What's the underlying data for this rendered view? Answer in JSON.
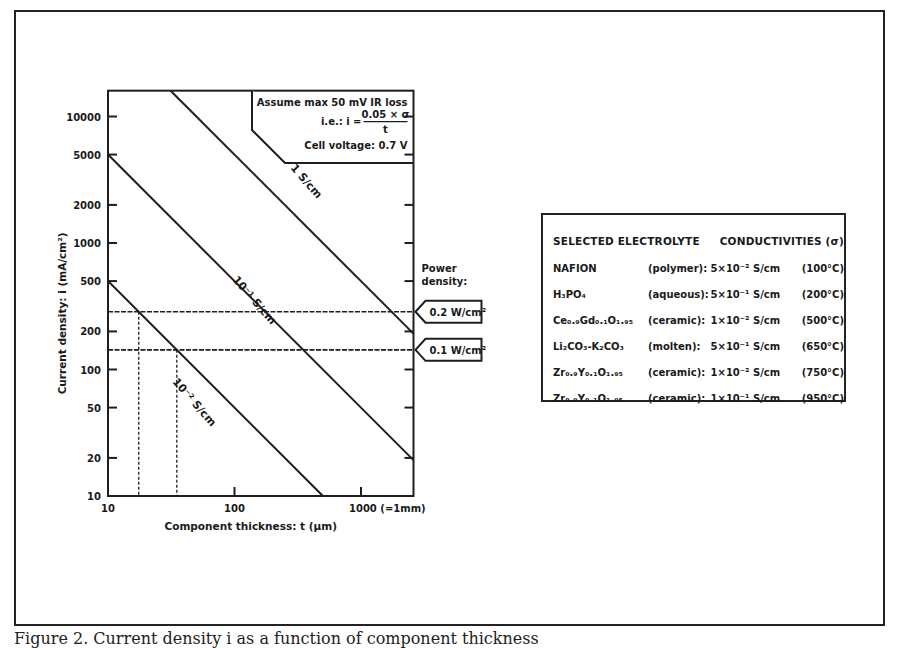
{
  "chart_data": {
    "type": "line",
    "xscale": "log",
    "yscale": "log",
    "xlabel": "Component thickness: t (µm)",
    "ylabel": "Current density: i (mA/cm²)",
    "xlim": [
      10,
      2600
    ],
    "ylim": [
      10,
      16000
    ],
    "xticks": [
      10,
      100,
      1000
    ],
    "xtick_labels": [
      "10",
      "100",
      "1000 (=1mm)"
    ],
    "yticks": [
      10,
      20,
      50,
      100,
      200,
      500,
      1000,
      2000,
      5000,
      10000
    ],
    "ytick_labels": [
      "10",
      "20",
      "50",
      "100",
      "200",
      "500",
      "1000",
      "2000",
      "5000",
      "10000"
    ],
    "formula": "i = 0.05 × σ / t",
    "series": [
      {
        "name": "1 S/cm",
        "sigma_S_per_cm": 1,
        "x": [
          31.25,
          2600
        ],
        "y": [
          16000,
          192
        ]
      },
      {
        "name": "10⁻¹ S/cm",
        "sigma_S_per_cm": 0.1,
        "x": [
          10,
          2600
        ],
        "y": [
          5000,
          19.2
        ]
      },
      {
        "name": "10⁻² S/cm",
        "sigma_S_per_cm": 0.01,
        "x": [
          10,
          500
        ],
        "y": [
          500,
          10
        ]
      }
    ],
    "reference_lines": [
      {
        "type": "horizontal",
        "y": 286,
        "label": "0.2 W/cm²",
        "style": "dashed"
      },
      {
        "type": "horizontal",
        "y": 143,
        "label": "0.1 W/cm²",
        "style": "dashed"
      },
      {
        "type": "vertical",
        "x": 17.5,
        "y_top": 286,
        "style": "dotted"
      },
      {
        "type": "vertical",
        "x": 35,
        "y_top": 143,
        "style": "dotted"
      }
    ],
    "annotations": {
      "box_line1": "Assume max 50 mV IR loss",
      "box_prefix": "i.e.:  i =",
      "box_numerator": "0.05 × σ",
      "box_denominator": "t",
      "box_line3": "Cell voltage: 0.7 V",
      "power_density_title_1": "Power",
      "power_density_title_2": "density:"
    },
    "line_labels": [
      "1 S/cm",
      "10⁻¹ S/cm",
      "10⁻² S/cm"
    ],
    "legend_position": "none",
    "grid": false
  },
  "table": {
    "header": [
      "SELECTED",
      "ELECTROLYTE",
      "CONDUCTIVITIES (σ)"
    ],
    "rows": [
      {
        "material": "NAFION",
        "type": "(polymer):",
        "value": "5×10⁻² S/cm",
        "temp": "(100°C)"
      },
      {
        "material": "H₃PO₄",
        "type": "(aqueous):",
        "value": "5×10⁻¹ S/cm",
        "temp": "(200°C)"
      },
      {
        "material": "Ce₀.₉Gd₀.₁O₁.₉₅",
        "type": "(ceramic):",
        "value": "1×10⁻² S/cm",
        "temp": "(500°C)"
      },
      {
        "material": "Li₂CO₃-K₂CO₃",
        "type": "(molten):",
        "value": "5×10⁻¹ S/cm",
        "temp": "(650°C)"
      },
      {
        "material": "Zr₀.₉Y₀.₁O₁.₉₅",
        "type": "(ceramic):",
        "value": "1×10⁻² S/cm",
        "temp": "(750°C)"
      },
      {
        "material": "Zr₀.₉Y₀.₁O₁.₉₅",
        "type": "(ceramic):",
        "value": "1×10⁻¹ S/cm",
        "temp": "(950°C)"
      }
    ]
  },
  "caption": "Figure 2.  Current density i as a function of component thickness"
}
